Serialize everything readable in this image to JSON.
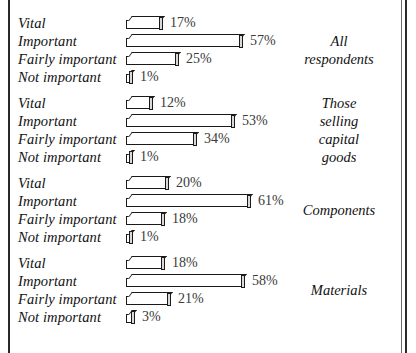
{
  "chart_data": {
    "type": "bar",
    "orientation": "horizontal",
    "title": "",
    "xlabel": "",
    "ylabel": "",
    "xlim": [
      0,
      61
    ],
    "grid": false,
    "legend_position": "right",
    "value_suffix": "%",
    "categories": [
      "Vital",
      "Important",
      "Fairly important",
      "Not important"
    ],
    "groups": [
      {
        "name": "All respondents",
        "caption_lines": [
          "All",
          "respondents"
        ],
        "values": [
          17,
          57,
          25,
          1
        ],
        "labels": [
          "17%",
          "57%",
          "25%",
          "1%"
        ]
      },
      {
        "name": "Those selling capital goods",
        "caption_lines": [
          "Those",
          "selling",
          "capital",
          "goods"
        ],
        "values": [
          12,
          53,
          34,
          1
        ],
        "labels": [
          "12%",
          "53%",
          "34%",
          "1%"
        ]
      },
      {
        "name": "Components",
        "caption_lines": [
          "Components"
        ],
        "values": [
          20,
          61,
          18,
          1
        ],
        "labels": [
          "20%",
          "61%",
          "18%",
          "1%"
        ]
      },
      {
        "name": "Materials",
        "caption_lines": [
          "Materials"
        ],
        "values": [
          18,
          58,
          21,
          3
        ],
        "labels": [
          "18%",
          "58%",
          "21%",
          "3%"
        ]
      }
    ]
  },
  "style": {
    "bar_fill": "#ffffff",
    "bar_outline": "#1a1a1a",
    "bar_cap": "#d9d9d9",
    "text_color": "#111111",
    "value_color": "#3a3a3a",
    "background": "#ffffff",
    "rule_color": "#2a2a2a"
  }
}
